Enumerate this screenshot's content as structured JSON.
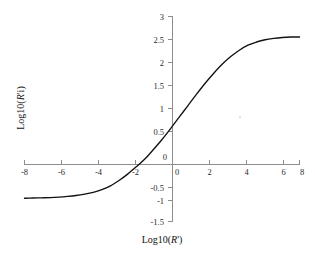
{
  "chart_data": {
    "type": "line",
    "title": "",
    "subtitle": "",
    "xlabel": "Log10(R')",
    "ylabel": "Log10(R'i)",
    "xlabel_parts": {
      "prefix": "Log10(",
      "italic": "R",
      "suffix": "')"
    },
    "ylabel_parts": {
      "prefix": "Log10(",
      "italic": "R",
      "suffix": "'i)"
    },
    "xlim": [
      -8,
      8
    ],
    "ylim": [
      -1.5,
      3
    ],
    "xticks": [
      -8,
      -6,
      -4,
      -2,
      0,
      2,
      4,
      6,
      8
    ],
    "xtick_labels": [
      "-8",
      "-6",
      "-4",
      "-2",
      "0",
      "2",
      "4",
      "6",
      "8"
    ],
    "yticks": [
      -1.5,
      -1,
      -0.5,
      0,
      0.5,
      1,
      1.5,
      2,
      2.5,
      3
    ],
    "ytick_labels": [
      "-1.5",
      "-1",
      "-0.5",
      "0",
      "0.5",
      "1",
      "1.5",
      "2",
      "2.5",
      "3"
    ],
    "grid": false,
    "legend": null,
    "legend_position": "none",
    "axes_style": "crossed-at-origin",
    "curve_color": "#111111",
    "axis_color": "#8d8d8d",
    "background_color": "#ffffff",
    "annotations": [],
    "series": [
      {
        "name": "Log10(R'i) vs Log10(R')",
        "asymptote_low": -1.0,
        "asymptote_high": 2.55,
        "x": [
          -8.0,
          -7.5,
          -7.0,
          -6.5,
          -6.0,
          -5.5,
          -5.0,
          -4.5,
          -4.0,
          -3.5,
          -3.0,
          -2.5,
          -2.0,
          -1.5,
          -1.0,
          -0.5,
          0.0,
          0.5,
          1.0,
          1.5,
          2.0,
          2.5,
          3.0,
          3.5,
          4.0,
          4.5,
          5.0,
          5.5,
          6.0,
          6.5,
          7.0,
          7.5,
          8.0
        ],
        "values": [
          -0.99,
          -0.985,
          -0.98,
          -0.975,
          -0.965,
          -0.95,
          -0.93,
          -0.9,
          -0.86,
          -0.8,
          -0.72,
          -0.6,
          -0.46,
          -0.3,
          -0.13,
          0.08,
          0.3,
          0.54,
          0.79,
          1.04,
          1.29,
          1.53,
          1.75,
          1.95,
          2.12,
          2.26,
          2.37,
          2.44,
          2.49,
          2.52,
          2.54,
          2.55,
          2.55
        ]
      }
    ]
  },
  "figure": {
    "caption": "",
    "artifact_note": "faint-speck"
  }
}
